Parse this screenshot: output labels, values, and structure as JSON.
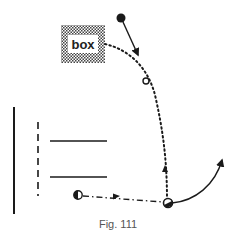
{
  "figure": {
    "caption": "Fig. 111",
    "box_label": "box",
    "colors": {
      "ink": "#1a1a1a",
      "caption": "#555555",
      "box_dots": "#444444"
    },
    "elements": [
      {
        "type": "box",
        "label": "box",
        "pattern": "dotted-stipple"
      },
      {
        "type": "ball",
        "fill": "solid",
        "note": "top ball with straight arrow pointing down-right"
      },
      {
        "type": "ball",
        "fill": "hollow",
        "note": "small open circle on dotted path"
      },
      {
        "type": "player",
        "fill": "half-filled",
        "note": "lower-left player, dash-dot pass to the right"
      },
      {
        "type": "player",
        "fill": "half-filled",
        "note": "lower-right player, dotted run upward, curved solid run up-right"
      },
      {
        "type": "goal-line",
        "style": "solid-vertical"
      },
      {
        "type": "penalty-line",
        "style": "dashed-vertical"
      },
      {
        "type": "line",
        "style": "solid-horizontal",
        "count": 2
      }
    ]
  }
}
